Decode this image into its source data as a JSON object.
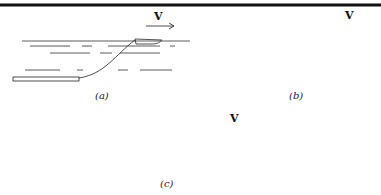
{
  "panels": [
    {
      "id": "a",
      "label": "(a)",
      "velocity_label": "V",
      "description": "Boat towing a long submerged rod/plank on a curved cable"
    },
    {
      "id": "b",
      "label": "(b)",
      "velocity_label": "V",
      "description": "Boat towing a small flexible body deep below on a long cable"
    },
    {
      "id": "c",
      "label": "(c)",
      "velocity_label": "V",
      "description": "Boat towing a floating body with a sagging cable between them"
    }
  ],
  "colors": {
    "ink": "#222222",
    "rule": "#111111",
    "background": "#ffffff"
  }
}
